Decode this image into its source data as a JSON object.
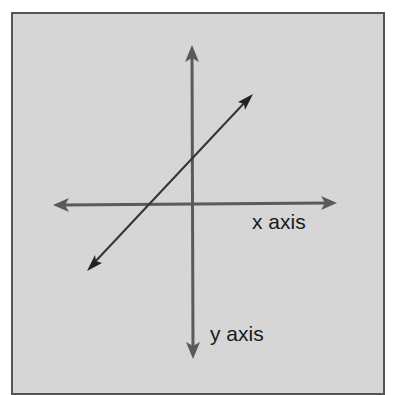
{
  "diagram": {
    "type": "coordinate-axes",
    "colors": {
      "background": "#d6d6d6",
      "frame": "#555555",
      "axis": "#5a5a5a",
      "line": "#333333",
      "text": "#1a1a1a"
    },
    "labels": {
      "x_axis": "x axis",
      "y_axis": "y axis"
    },
    "x_axis": {
      "from": [
        53,
        205
      ],
      "to": [
        337,
        203
      ]
    },
    "y_axis": {
      "from": [
        192,
        45
      ],
      "to": [
        193,
        359
      ]
    },
    "diagonal_line": {
      "from": [
        87,
        271
      ],
      "to": [
        253,
        94
      ]
    }
  }
}
